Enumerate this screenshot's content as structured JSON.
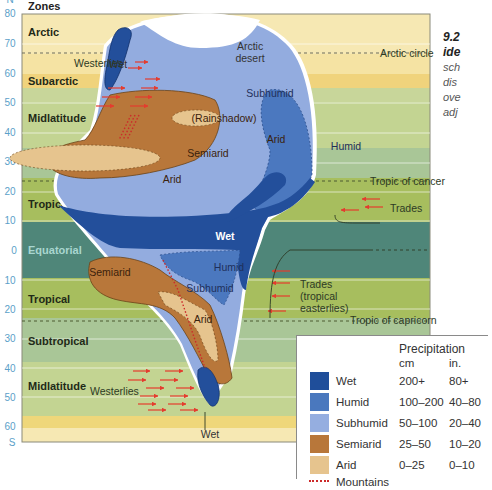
{
  "figure": {
    "axis_header": "Zones",
    "latitude_ticks_north": [
      "80",
      "70",
      "60",
      "50",
      "40",
      "30",
      "20",
      "10",
      "0"
    ],
    "latitude_ticks_south": [
      "10",
      "20",
      "30",
      "40",
      "50",
      "60"
    ],
    "hemisphere_top": "N",
    "hemisphere_bottom": "S",
    "zones": [
      {
        "label": "Arctic",
        "color": "#f5e6ad"
      },
      {
        "label": "Subarctic",
        "color": "#f0d27a"
      },
      {
        "label": "Midlatitude",
        "color": "#c5d596"
      },
      {
        "label": "Subtropical",
        "color": "#a8c595"
      },
      {
        "label": "Tropical",
        "color": "#a8bf5f"
      },
      {
        "label": "Equatorial",
        "color": "#4e8577"
      },
      {
        "label": "Tropical",
        "color": "#a8bf5f"
      },
      {
        "label": "Subtropical",
        "color": "#a8c595"
      },
      {
        "label": "Midlatitude",
        "color": "#c5d596"
      }
    ],
    "reference_lines": {
      "arctic_circle": "Arctic circle",
      "tropic_cancer": "Tropic of cancer",
      "tropic_capricorn": "Tropic of capricorn"
    },
    "winds": {
      "westerlies_north": "Westerlies",
      "westerlies_south": "Westerlies",
      "trades_north": "Trades",
      "trades_south_1": "Trades",
      "trades_south_2": "(tropical",
      "trades_south_3": "easterlies)"
    },
    "regions": {
      "arctic_desert_1": "Arctic",
      "arctic_desert_2": "desert",
      "wet_north_coast": "Wet",
      "subhumid": "Subhumid",
      "rainshadow": "(Rainshadow)",
      "arid_inner": "Arid",
      "humid_east": "Humid",
      "semiarid": "Semiarid",
      "arid_west": "Arid",
      "wet_equator": "Wet",
      "semiarid_south": "Semiarid",
      "humid_south": "Humid",
      "subhumid_south": "Subhumid",
      "arid_south": "Arid",
      "wet_south_tip": "Wet"
    }
  },
  "caption": {
    "title_1": "9.2",
    "title_2": "ide",
    "line_1": "sch",
    "line_2": "dis",
    "line_3": "ove",
    "line_4": "adj"
  },
  "legend": {
    "title": "Precipitation",
    "unit_cm": "cm",
    "unit_in": "in.",
    "items": [
      {
        "name": "Wet",
        "cm": "200+",
        "in": "80+",
        "color": "#1f4e9a"
      },
      {
        "name": "Humid",
        "cm": "100–200",
        "in": "40–80",
        "color": "#4a78be"
      },
      {
        "name": "Subhumid",
        "cm": "50–100",
        "in": "20–40",
        "color": "#95aee0"
      },
      {
        "name": "Semiarid",
        "cm": "25–50",
        "in": "10–20",
        "color": "#b8773a"
      },
      {
        "name": "Arid",
        "cm": "0–25",
        "in": "0–10",
        "color": "#e6c48e"
      }
    ],
    "mountains_label": "Mountains",
    "mountains_color": "#cc2a2a"
  }
}
